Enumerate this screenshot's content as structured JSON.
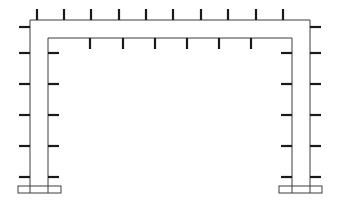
{
  "figure": {
    "canvas": {
      "width": 340,
      "height": 218,
      "background": "#ffffff"
    },
    "colors": {
      "outline": "#3c3c3c",
      "stiffener": "#1a1a1a",
      "background": "#ffffff"
    },
    "line_weights": {
      "outline": 1,
      "stiffener": 2.2
    }
  },
  "geometry": {
    "outer_frame": {
      "label": "outer-frame-outline",
      "left_x": 30,
      "right_x": 310,
      "top_y": 20,
      "bottom_y": 193,
      "points": "30,193 30,20 310,20 310,193"
    },
    "inner_frame": {
      "label": "inner-frame-outline",
      "left_x": 48,
      "right_x": 292,
      "top_y": 38,
      "bottom_y": 193,
      "points": "48,193 48,38 292,38 292,193"
    },
    "left_baseplate": {
      "label": "left-base-plate",
      "x": 18,
      "y": 186,
      "width": 43,
      "height": 7
    },
    "right_baseplate": {
      "label": "right-base-plate",
      "x": 279,
      "y": 186,
      "width": 43,
      "height": 7
    }
  },
  "stiffeners": {
    "outer_top_beam": {
      "label": "outer-top-beam-stiffeners",
      "count": 9,
      "orientation": "vertical",
      "length": 11,
      "attach_y": 20,
      "direction": "up",
      "x_positions": [
        37,
        64,
        91,
        119,
        146,
        173,
        201,
        228,
        256,
        283
      ]
    },
    "inner_top_beam": {
      "label": "inner-top-beam-stiffeners",
      "count": 6,
      "orientation": "vertical",
      "length": 11,
      "attach_y": 38,
      "direction": "down",
      "x_positions": [
        90,
        123,
        155,
        187,
        219,
        251
      ]
    },
    "outer_left_column": {
      "label": "outer-left-column-stiffeners",
      "count": 6,
      "orientation": "horizontal",
      "length": 11,
      "attach_x": 30,
      "direction": "left",
      "y_positions": [
        27,
        53,
        84,
        115,
        146,
        177
      ]
    },
    "inner_left_column": {
      "label": "inner-left-column-stiffeners",
      "count": 5,
      "orientation": "horizontal",
      "length": 11,
      "attach_x": 48,
      "direction": "right",
      "y_positions": [
        53,
        84,
        115,
        146,
        177
      ]
    },
    "outer_right_column": {
      "label": "outer-right-column-stiffeners",
      "count": 6,
      "orientation": "horizontal",
      "length": 11,
      "attach_x": 310,
      "direction": "right",
      "y_positions": [
        27,
        53,
        84,
        115,
        146,
        177
      ]
    },
    "inner_right_column": {
      "label": "inner-right-column-stiffeners",
      "count": 5,
      "orientation": "horizontal",
      "length": 11,
      "attach_x": 292,
      "direction": "left",
      "y_positions": [
        53,
        84,
        115,
        146,
        177
      ]
    }
  }
}
